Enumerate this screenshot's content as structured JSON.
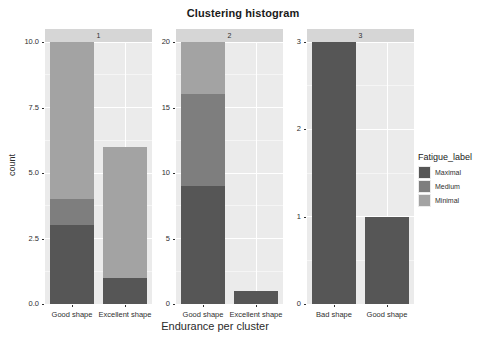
{
  "chart_data": {
    "type": "bar",
    "title": "Clustering histogram",
    "xlabel": "Endurance per cluster",
    "ylabel": "count",
    "stacked": true,
    "grid": true,
    "legend_position": "right",
    "legend_title": "Fatigue_label",
    "series": [
      {
        "name": "Maximal",
        "color": "#565656"
      },
      {
        "name": "Medium",
        "color": "#7e7e7e"
      },
      {
        "name": "Minimal",
        "color": "#a3a3a3"
      }
    ],
    "facet_variable": "cluster",
    "facets": [
      {
        "label": "1",
        "ylim": [
          0,
          10
        ],
        "yticks": [
          "0.0",
          "2.5",
          "5.0",
          "7.5",
          "10.0"
        ],
        "ytick_values": [
          0,
          2.5,
          5,
          7.5,
          10
        ],
        "categories": [
          "Good shape",
          "Excellent shape"
        ],
        "bars": [
          {
            "category": "Good shape",
            "total": 10,
            "values": {
              "Maximal": 3,
              "Medium": 1,
              "Minimal": 6
            }
          },
          {
            "category": "Excellent shape",
            "total": 6,
            "values": {
              "Maximal": 1,
              "Medium": 0,
              "Minimal": 5
            }
          }
        ]
      },
      {
        "label": "2",
        "ylim": [
          0,
          20
        ],
        "yticks": [
          "0",
          "5",
          "10",
          "15",
          "20"
        ],
        "ytick_values": [
          0,
          5,
          10,
          15,
          20
        ],
        "categories": [
          "Good shape",
          "Excellent shape"
        ],
        "bars": [
          {
            "category": "Good shape",
            "total": 20,
            "values": {
              "Maximal": 9,
              "Medium": 7,
              "Minimal": 4
            }
          },
          {
            "category": "Excellent shape",
            "total": 1,
            "values": {
              "Maximal": 1,
              "Medium": 0,
              "Minimal": 0
            }
          }
        ]
      },
      {
        "label": "3",
        "ylim": [
          0,
          3
        ],
        "yticks": [
          "0",
          "1",
          "2",
          "3"
        ],
        "ytick_values": [
          0,
          1,
          2,
          3
        ],
        "categories": [
          "Bad shape",
          "Good shape"
        ],
        "bars": [
          {
            "category": "Bad shape",
            "total": 3,
            "values": {
              "Maximal": 3,
              "Medium": 0,
              "Minimal": 0
            }
          },
          {
            "category": "Good shape",
            "total": 1,
            "values": {
              "Maximal": 1,
              "Medium": 0,
              "Minimal": 0
            }
          }
        ]
      }
    ]
  },
  "legend": {
    "title": "Fatigue_label",
    "items": [
      {
        "label": "Maximal",
        "color": "#565656"
      },
      {
        "label": "Medium",
        "color": "#7e7e7e"
      },
      {
        "label": "Minimal",
        "color": "#a3a3a3"
      }
    ]
  },
  "colors": {
    "panel_background": "#ebebeb",
    "strip_background": "#d6d6d6",
    "gridline": "#ffffff",
    "page_background": "#ffffff",
    "text": "#2f2f2f"
  }
}
